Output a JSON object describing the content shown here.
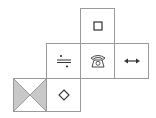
{
  "diagram": {
    "type": "cube-net",
    "line_color": "#9a9a9a",
    "shade_color": "#c8c8c8",
    "symbol_color": "#333333",
    "faces": [
      {
        "id": "top",
        "row": 0,
        "col": 2,
        "symbol": "small-square",
        "glyph": "□"
      },
      {
        "id": "mid-left",
        "row": 1,
        "col": 1,
        "symbol": "division-sign",
        "glyph": "÷"
      },
      {
        "id": "mid-center",
        "row": 1,
        "col": 2,
        "symbol": "telephone",
        "glyph": "☎"
      },
      {
        "id": "mid-right",
        "row": 1,
        "col": 3,
        "symbol": "left-right-arrow",
        "glyph": "↔"
      },
      {
        "id": "bottom-left",
        "row": 2,
        "col": 0,
        "symbol": "hourglass-shaded-triangles",
        "glyph": "⧗"
      },
      {
        "id": "bottom-center",
        "row": 2,
        "col": 1,
        "symbol": "diamond",
        "glyph": "◇"
      }
    ]
  }
}
